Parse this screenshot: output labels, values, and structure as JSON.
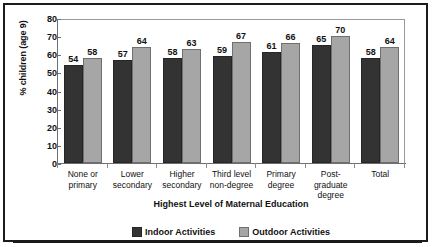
{
  "chart_data": {
    "type": "bar",
    "title": "",
    "xlabel": "Highest Level of Maternal Education",
    "ylabel": "% children (age 9)",
    "ylim": [
      0,
      80
    ],
    "ytick_step": 10,
    "yticks": [
      "80",
      "70",
      "60",
      "50",
      "40",
      "30",
      "20",
      "10",
      "0"
    ],
    "grid": false,
    "legend_position": "bottom",
    "categories": [
      "None or primary",
      "Lower secondary",
      "Higher secondary",
      "Third level non-degree",
      "Primary degree",
      "Post-graduate degree",
      "Total"
    ],
    "category_lines": [
      [
        "None or",
        "primary"
      ],
      [
        "Lower",
        "secondary"
      ],
      [
        "Higher",
        "secondary"
      ],
      [
        "Third level",
        "non-degree"
      ],
      [
        "Primary",
        "degree"
      ],
      [
        "Post-",
        "graduate",
        "degree"
      ],
      [
        "Total"
      ]
    ],
    "series": [
      {
        "name": "Indoor Activities",
        "color": "#333333",
        "values": [
          54,
          57,
          58,
          59,
          61,
          65,
          58
        ]
      },
      {
        "name": "Outdoor Activities",
        "color": "#a6a6a6",
        "values": [
          58,
          64,
          63,
          67,
          66,
          70,
          64
        ]
      }
    ]
  },
  "legend": {
    "items": [
      {
        "label": "Indoor Activities",
        "swatch": "indoor"
      },
      {
        "label": "Outdoor Activities",
        "swatch": "outdoor"
      }
    ]
  },
  "colors": {
    "indoor": "#333333",
    "outdoor": "#a6a6a6",
    "frame": "#1b1b1b",
    "axis": "#6e6e6e"
  }
}
